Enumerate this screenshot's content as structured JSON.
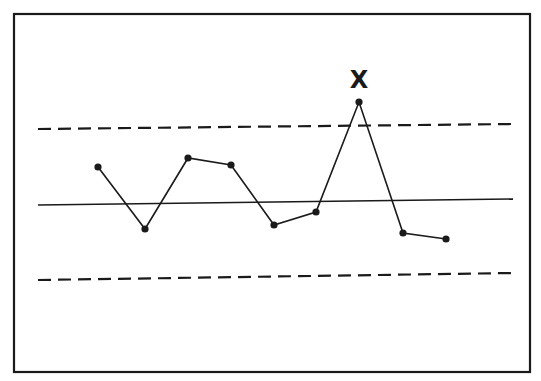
{
  "chart_data": {
    "type": "line",
    "title": "",
    "xlabel": "",
    "ylabel": "",
    "grid": false,
    "legend": null,
    "x": [
      1,
      2,
      3,
      4,
      5,
      6,
      7,
      8,
      9
    ],
    "series": [
      {
        "name": "observations",
        "values": [
          0.49,
          -0.31,
          0.61,
          0.52,
          -0.27,
          -0.09,
          1.29,
          -0.38,
          -0.47
        ]
      }
    ],
    "reference_lines": [
      {
        "name": "upper-control-limit",
        "style": "dashed",
        "value": 1.0
      },
      {
        "name": "center-line",
        "style": "solid",
        "value": 0.0
      },
      {
        "name": "lower-control-limit",
        "style": "dashed",
        "value": -1.0
      }
    ],
    "annotations": [
      {
        "text": "X",
        "at_point_index": 6,
        "meaning": "out-of-control point"
      }
    ],
    "ylim": [
      -2.2,
      2.5
    ]
  },
  "render": {
    "frame": {
      "x": 14,
      "y": 14,
      "w": 516,
      "h": 358
    },
    "ucl": {
      "x1": 38,
      "y1": 129,
      "x2": 513,
      "y2": 124
    },
    "cl": {
      "x1": 38,
      "y1": 205,
      "x2": 513,
      "y2": 199
    },
    "lcl": {
      "x1": 38,
      "y1": 280,
      "x2": 513,
      "y2": 273
    },
    "points": [
      [
        98,
        167
      ],
      [
        145,
        229
      ],
      [
        188,
        158
      ],
      [
        231,
        165
      ],
      [
        274,
        225
      ],
      [
        316,
        212
      ],
      [
        359,
        102
      ],
      [
        403,
        233
      ],
      [
        446,
        239
      ]
    ],
    "flag": {
      "x": 359,
      "y": 80,
      "label": "X"
    },
    "color": "#1a1a1a"
  }
}
